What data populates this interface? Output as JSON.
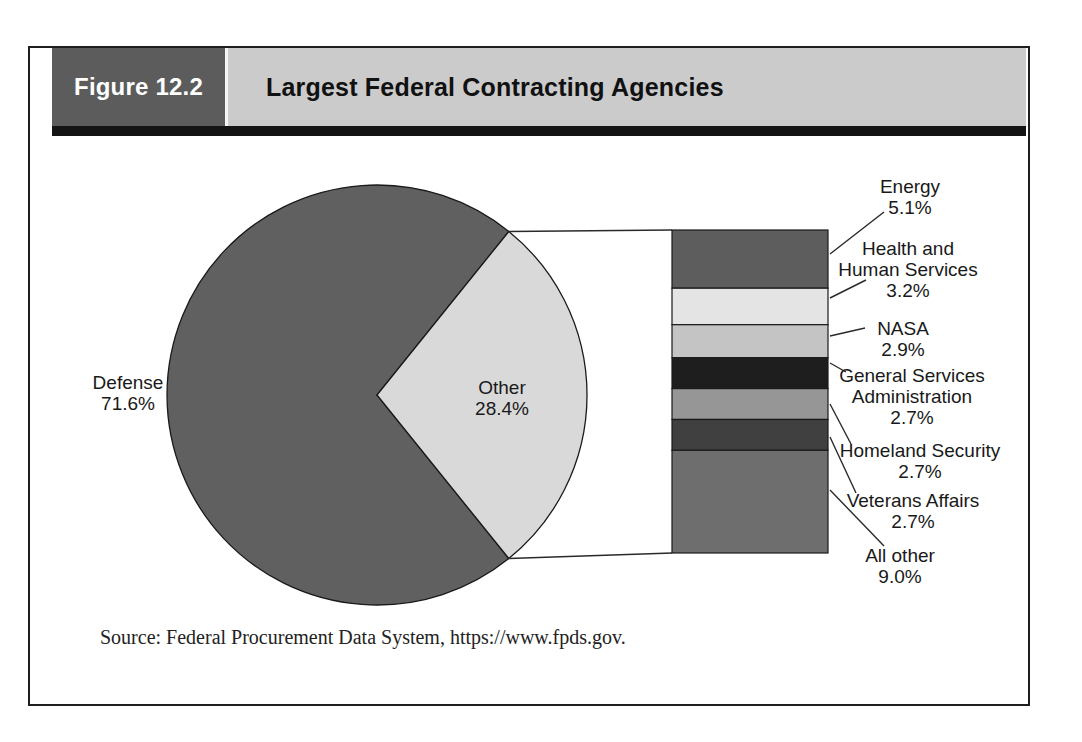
{
  "figure": {
    "label": "Figure 12.2",
    "title": "Largest Federal Contracting Agencies"
  },
  "source": "Source: Federal Procurement Data System, https://www.fpds.gov.",
  "colors": {
    "header_box": "#5c5c5c",
    "header_bar": "#cbcbcb",
    "frame_border": "#1f1f1f",
    "line": "#2a2a2a"
  },
  "chart_data": {
    "type": "pie",
    "title": "Largest Federal Contracting Agencies",
    "slices": [
      {
        "label": "Defense",
        "value": 71.6,
        "display": "71.6%",
        "color": "#606060"
      },
      {
        "label": "Other",
        "value": 28.4,
        "display": "28.4%",
        "color": "#d9d9d9"
      }
    ],
    "breakout": {
      "of": "Other",
      "style": "stacked-bar",
      "segments": [
        {
          "label": "Energy",
          "value": 5.1,
          "display": "5.1%",
          "color": "#5d5d5d"
        },
        {
          "label": "Health and\nHuman Services",
          "value": 3.2,
          "display": "3.2%",
          "color": "#e4e4e4"
        },
        {
          "label": "NASA",
          "value": 2.9,
          "display": "2.9%",
          "color": "#c4c4c4"
        },
        {
          "label": "General Services\nAdministration",
          "value": 2.7,
          "display": "2.7%",
          "color": "#1e1e1e"
        },
        {
          "label": "Homeland Security",
          "value": 2.7,
          "display": "2.7%",
          "color": "#969696"
        },
        {
          "label": "Veterans Affairs",
          "value": 2.7,
          "display": "2.7%",
          "color": "#404040"
        },
        {
          "label": "All other",
          "value": 9.0,
          "display": "9.0%",
          "color": "#6e6e6e"
        }
      ]
    }
  }
}
